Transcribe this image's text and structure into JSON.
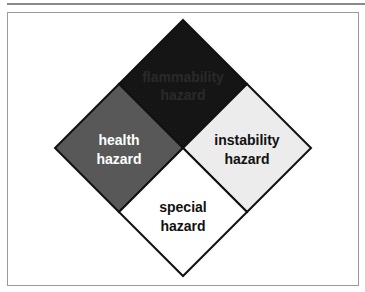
{
  "diagram": {
    "title": "",
    "quadrants": [
      {
        "id": "top",
        "line1": "flammability",
        "line2": "hazard",
        "fill": "#151515",
        "text_color": "#2a2a2a"
      },
      {
        "id": "left",
        "line1": "health",
        "line2": "hazard",
        "fill": "#585858",
        "text_color": "#ffffff"
      },
      {
        "id": "right",
        "line1": "instability",
        "line2": "hazard",
        "fill": "#ececec",
        "text_color": "#111111"
      },
      {
        "id": "bottom",
        "line1": "special",
        "line2": "hazard",
        "fill": "#ffffff",
        "text_color": "#111111"
      }
    ],
    "stroke_color": "#111111",
    "frame_color": "#9a9a9a"
  }
}
